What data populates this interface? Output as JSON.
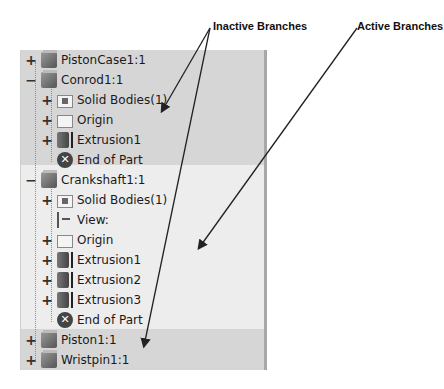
{
  "annotations": {
    "inactive_label": "Inactive Branches",
    "active_label": "Active Branches"
  },
  "tree": {
    "items": [
      {
        "label": "PistonCase1:1",
        "expander": "+",
        "icon": "part-cube-icon",
        "level": 0
      },
      {
        "label": "Conrod1:1",
        "expander": "−",
        "icon": "part-cube-icon",
        "level": 0
      },
      {
        "label": "Solid Bodies(1)",
        "expander": "+",
        "icon": "solid-bodies-folder-icon",
        "level": 1
      },
      {
        "label": "Origin",
        "expander": "+",
        "icon": "folder-icon",
        "level": 1
      },
      {
        "label": "Extrusion1",
        "expander": "+",
        "icon": "extrusion-icon",
        "level": 1
      },
      {
        "label": "End of Part",
        "expander": "",
        "icon": "end-of-part-icon",
        "level": 1
      },
      {
        "label": "Crankshaft1:1",
        "expander": "−",
        "icon": "part-cube-icon",
        "level": 0
      },
      {
        "label": "Solid Bodies(1)",
        "expander": "+",
        "icon": "solid-bodies-folder-icon",
        "level": 1
      },
      {
        "label": "View:",
        "expander": "",
        "icon": "view-icon",
        "level": 1
      },
      {
        "label": "Origin",
        "expander": "+",
        "icon": "folder-icon",
        "level": 1
      },
      {
        "label": "Extrusion1",
        "expander": "+",
        "icon": "extrusion-icon",
        "level": 1
      },
      {
        "label": "Extrusion2",
        "expander": "+",
        "icon": "extrusion-icon",
        "level": 1
      },
      {
        "label": "Extrusion3",
        "expander": "+",
        "icon": "extrusion-icon",
        "level": 1
      },
      {
        "label": "End of Part",
        "expander": "",
        "icon": "end-of-part-icon",
        "level": 1
      },
      {
        "label": "Piston1:1",
        "expander": "+",
        "icon": "part-cube-icon",
        "level": 0
      },
      {
        "label": "Wristpin1:1",
        "expander": "+",
        "icon": "part-cube-icon",
        "level": 0
      }
    ]
  },
  "colors": {
    "inactive_band": "#d6d6d6",
    "active_band": "#ededed",
    "arrow": "#222222"
  }
}
